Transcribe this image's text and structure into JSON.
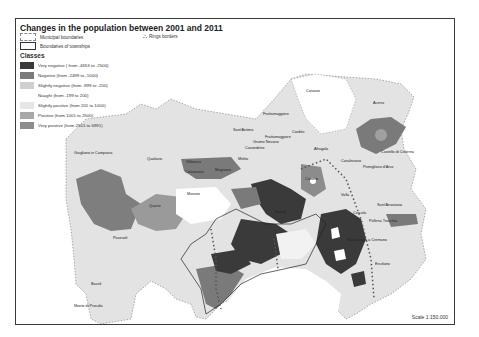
{
  "title": "Changes in the population between 2001 and 2011",
  "legend": {
    "municipal_boundaries": "Municipal boundaries",
    "township_boundaries": "Boundaries of townships",
    "ring_borders": "Rings borders",
    "ring_icon": "car-icon"
  },
  "classes": {
    "heading": "Classes",
    "items": [
      {
        "label": "Very negative ( from -4653 to -2500)",
        "color": "#3a3a3a"
      },
      {
        "label": "Negative (from -2499 to -1000)",
        "color": "#7a7a7a"
      },
      {
        "label": "Slightly negative (from -999 to -200)",
        "color": "#cfcfcf"
      },
      {
        "label": "Naught (from -199 to 200)",
        "color": "#ffffff"
      },
      {
        "label": "Slightly positive (from 201 to 1000)",
        "color": "#e6e6e6"
      },
      {
        "label": "Positive (from 1001 to 2500)",
        "color": "#a8a8a8"
      },
      {
        "label": "Very positive (from 2501 to 6891)",
        "color": "#8c8c8c"
      }
    ]
  },
  "places": [
    {
      "name": "Caivano",
      "x": 305,
      "y": 87
    },
    {
      "name": "Acerra",
      "x": 372,
      "y": 99
    },
    {
      "name": "Frattamaggiore",
      "x": 262,
      "y": 110
    },
    {
      "name": "Sant'Antimo",
      "x": 232,
      "y": 126
    },
    {
      "name": "Frattamaggiore",
      "x": 262,
      "y": 133
    },
    {
      "name": "Grumo Nevano",
      "x": 252,
      "y": 138
    },
    {
      "name": "Casandrino",
      "x": 244,
      "y": 144
    },
    {
      "name": "Cardito",
      "x": 290,
      "y": 128
    },
    {
      "name": "Afragola",
      "x": 313,
      "y": 145
    },
    {
      "name": "Castello di Cisterna",
      "x": 380,
      "y": 148
    },
    {
      "name": "Casalnuovo",
      "x": 340,
      "y": 157
    },
    {
      "name": "Pomigliano d'Arco",
      "x": 362,
      "y": 163
    },
    {
      "name": "Giugliano in Campania",
      "x": 73,
      "y": 149
    },
    {
      "name": "Qualiano",
      "x": 146,
      "y": 155
    },
    {
      "name": "Villaricca",
      "x": 185,
      "y": 158
    },
    {
      "name": "Melito",
      "x": 237,
      "y": 155
    },
    {
      "name": "Calvizzano",
      "x": 184,
      "y": 168
    },
    {
      "name": "Mugnano",
      "x": 214,
      "y": 166
    },
    {
      "name": "Marano",
      "x": 186,
      "y": 190
    },
    {
      "name": "Casoria",
      "x": 304,
      "y": 175
    },
    {
      "name": "Volla",
      "x": 340,
      "y": 191
    },
    {
      "name": "Napoli",
      "x": 274,
      "y": 208
    },
    {
      "name": "Sant'Anastasia",
      "x": 376,
      "y": 201
    },
    {
      "name": "Quarto",
      "x": 148,
      "y": 202
    },
    {
      "name": "Cercola",
      "x": 352,
      "y": 209
    },
    {
      "name": "Pollena Trocchia",
      "x": 368,
      "y": 217
    },
    {
      "name": "Pozzuoli",
      "x": 112,
      "y": 234
    },
    {
      "name": "San Giorgio a Cremano",
      "x": 346,
      "y": 236
    },
    {
      "name": "Ercolano",
      "x": 374,
      "y": 260
    },
    {
      "name": "Bacoli",
      "x": 90,
      "y": 280
    },
    {
      "name": "Monte di Procida",
      "x": 73,
      "y": 302
    }
  ],
  "scale": "Scale 1:150.000"
}
